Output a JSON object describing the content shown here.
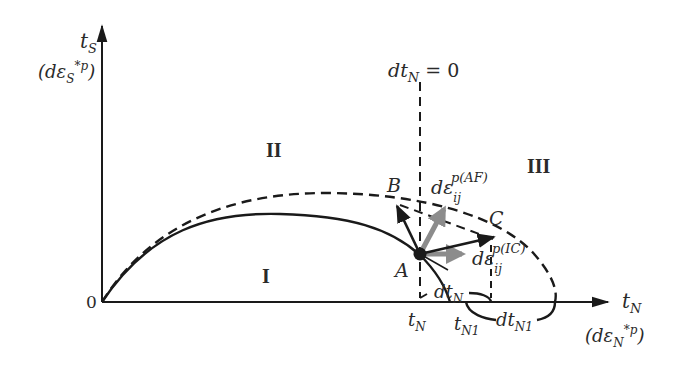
{
  "diagram": {
    "axes": {
      "y_label": "t",
      "y_label_sub": "S",
      "y_label_alt_prefix": "(dε",
      "y_label_alt_sub": "S",
      "y_label_alt_sup": "*p",
      "y_label_alt_suffix": ")",
      "x_label": "t",
      "x_label_sub": "N",
      "x_label_alt_prefix": "(dε",
      "x_label_alt_sub": "N",
      "x_label_alt_sup": "*p",
      "x_label_alt_suffix": ")",
      "origin": "0"
    },
    "regions": {
      "region_1": "I",
      "region_2": "II",
      "region_3": "III"
    },
    "points": {
      "a": "A",
      "b": "B",
      "c": "C"
    },
    "vertical_line": {
      "label_prefix": "dt",
      "label_sub": "N",
      "label_suffix": " = 0"
    },
    "vectors": {
      "af_prefix": "dε",
      "af_sub": "ij",
      "af_sup": "p(AF)",
      "ic_prefix": "dε",
      "ic_sub": "ij",
      "ic_sup": "p(IC)"
    },
    "tick_labels": {
      "tn": "t",
      "tn_sub": "N",
      "tn1": "t",
      "tn1_sub": "N1",
      "dtn": "dt",
      "dtn_sub": "N",
      "dtn1": "dt",
      "dtn1_sub": "N1"
    },
    "colors": {
      "line": "#1a1a1a",
      "gray_vector": "#8c8c8c"
    }
  }
}
